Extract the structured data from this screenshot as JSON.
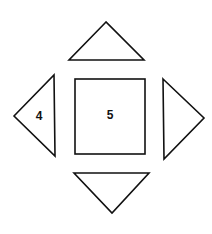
{
  "diagram": {
    "shapes": [
      {
        "id": "top-triangle",
        "kind": "triangle",
        "pointing": "up",
        "label": ""
      },
      {
        "id": "left-triangle",
        "kind": "triangle",
        "pointing": "left",
        "label": "4"
      },
      {
        "id": "center-square",
        "kind": "square",
        "label": "5"
      },
      {
        "id": "right-triangle",
        "kind": "triangle",
        "pointing": "right",
        "label": ""
      },
      {
        "id": "bottom-triangle",
        "kind": "triangle",
        "pointing": "down",
        "label": ""
      }
    ],
    "colors": {
      "stroke": "#111111",
      "background": "#ffffff"
    }
  }
}
